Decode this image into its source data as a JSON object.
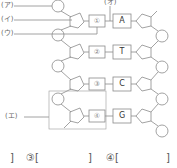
{
  "labels": {
    "a": "(ア)",
    "i": "(イ)",
    "u": "(ウ)",
    "e": "(エ)",
    "o": "(オ)"
  },
  "pairs": [
    {
      "num": "①",
      "base": "A"
    },
    {
      "num": "②",
      "base": "T"
    },
    {
      "num": "③",
      "base": "C"
    },
    {
      "num": "④",
      "base": "G"
    }
  ],
  "answers": {
    "close_prev": "]",
    "q3": "③[",
    "q3_close": "]",
    "q4": "④[",
    "q4_close": "]"
  },
  "colors": {
    "line": "#888888",
    "text": "#555555"
  }
}
